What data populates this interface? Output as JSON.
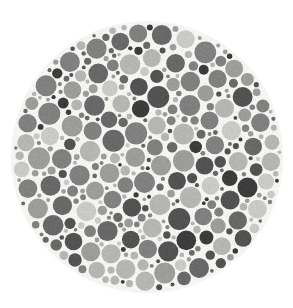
{
  "image": {
    "kind": "ishihara-color-vision-test-plate",
    "title": "Ishihara Test Plate (grayscale)",
    "width": 293,
    "height": 308,
    "background_color": "#ffffff"
  },
  "plate": {
    "shape": "circle",
    "center_x": 147,
    "center_y": 157,
    "radius": 136,
    "gap_color": "#f6f4f1",
    "dot_count_approx": 620,
    "dot_min_diameter": 4,
    "dot_max_diameter": 22
  },
  "palette": {
    "very_light": "#c9c9c7",
    "light": "#b5b5b3",
    "medium_light": "#9c9c9a",
    "medium": "#808080",
    "medium_dark": "#686868",
    "dark": "#525252",
    "very_dark": "#3c3c3c",
    "background": "#ffffff",
    "gap": "#f6f4f1"
  },
  "palette_weights": {
    "very_light": 0.1,
    "light": 0.17,
    "medium_light": 0.17,
    "medium": 0.19,
    "medium_dark": 0.15,
    "dark": 0.13,
    "very_dark": 0.09
  },
  "size_distribution": {
    "radii": [
      2.2,
      3.0,
      4.0,
      5.0,
      6.2,
      7.4,
      8.6,
      10.0
    ],
    "weights": [
      0.16,
      0.15,
      0.15,
      0.15,
      0.14,
      0.12,
      0.08,
      0.05
    ]
  },
  "render": {
    "seed": 20240917,
    "packing_attempts": 26000,
    "min_gap": 0.9,
    "edge_inset": 1.5,
    "noise_amount": 11,
    "edge_softness": 0.55
  },
  "accessibility": {
    "alt_text": "Circular Ishihara color vision test plate composed of many small dots of varying gray shades and sizes, rendered in grayscale on a white background."
  }
}
